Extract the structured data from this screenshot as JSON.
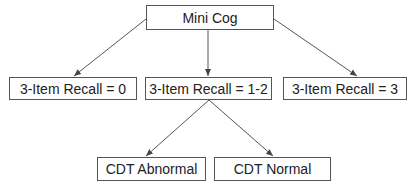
{
  "diagram": {
    "type": "tree",
    "line_color": "#555555",
    "nodes": {
      "root": {
        "label": "Mini Cog"
      },
      "recall_0": {
        "label": "3-Item Recall = 0"
      },
      "recall_1_2": {
        "label": "3-Item Recall = 1-2"
      },
      "recall_3": {
        "label": "3-Item Recall = 3"
      },
      "cdt_abnormal": {
        "label": "CDT Abnormal"
      },
      "cdt_normal": {
        "label": "CDT Normal"
      }
    },
    "edges": [
      {
        "from": "root",
        "to": "recall_0"
      },
      {
        "from": "root",
        "to": "recall_1_2"
      },
      {
        "from": "root",
        "to": "recall_3"
      },
      {
        "from": "recall_1_2",
        "to": "cdt_abnormal"
      },
      {
        "from": "recall_1_2",
        "to": "cdt_normal"
      }
    ]
  }
}
